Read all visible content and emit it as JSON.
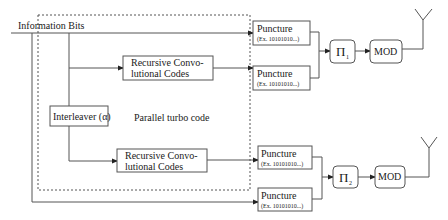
{
  "diagram": {
    "title": "Parallel turbo code",
    "input_label": "Information Bits",
    "interleaver": {
      "label": "Interleaver (α)"
    },
    "encoders": [
      {
        "line1": "Recursive Convo-",
        "line2": "lutional Codes"
      },
      {
        "line1": "Recursive Convo-",
        "line2": "lutional Codes"
      }
    ],
    "punctures": [
      {
        "label": "Puncture",
        "pattern": "(Ex. 10101010...)"
      },
      {
        "label": "Puncture",
        "pattern": "(Ex. 10101010...)"
      },
      {
        "label": "Puncture",
        "pattern": "(Ex. 10101010...)"
      },
      {
        "label": "Puncture",
        "pattern": "(Ex. 10101010...)"
      }
    ],
    "permuters": [
      {
        "symbol": "Π",
        "index": "1"
      },
      {
        "symbol": "Π",
        "index": "2"
      }
    ],
    "modulators": [
      {
        "label": "MOD"
      },
      {
        "label": "MOD"
      }
    ],
    "antennas": [
      "antenna-1",
      "antenna-2"
    ]
  }
}
